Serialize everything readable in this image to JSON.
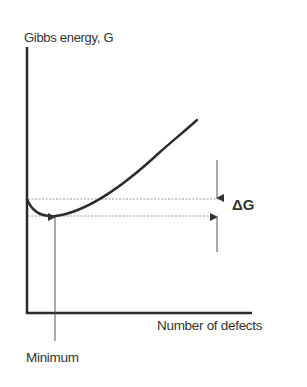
{
  "diagram": {
    "y_axis_label": "Gibbs energy, G",
    "x_axis_label": "Number of defects",
    "minimum_label": "Minimum",
    "delta_label": "ΔG",
    "colors": {
      "axis": "#2b2b2b",
      "curve": "#2b2b2b",
      "guide_line": "#9a9a9a",
      "arrow": "#555555",
      "text": "#333333"
    },
    "curve": {
      "description": "G curve starts at axis, dips to a minimum, then rises steeply",
      "start_point": [
        27,
        199
      ],
      "minimum_point": [
        55,
        216
      ],
      "end_point": [
        197,
        120
      ]
    },
    "guide_lines": [
      {
        "name": "starting-energy-level",
        "y": 199
      },
      {
        "name": "minimum-energy-level",
        "y": 216
      }
    ]
  }
}
